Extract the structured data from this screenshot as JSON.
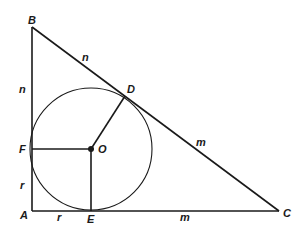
{
  "diagram": {
    "points": {
      "A": "A",
      "B": "B",
      "C": "C",
      "D": "D",
      "E": "E",
      "F": "F",
      "O": "O"
    },
    "segment_labels": {
      "BD": "n",
      "BF": "n",
      "FA": "r",
      "AE": "r",
      "DC": "m",
      "EC": "m"
    },
    "stroke_color": "#1a1a1a",
    "background": "#ffffff"
  }
}
